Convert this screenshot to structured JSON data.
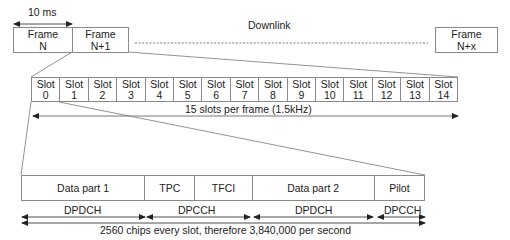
{
  "diagram": {
    "title": "Downlink",
    "frame_duration": "10 ms",
    "frames": [
      {
        "line1": "Frame",
        "line2": "N"
      },
      {
        "line1": "Frame",
        "line2": "N+1"
      },
      {
        "line1": "Frame",
        "line2": "N+x"
      }
    ],
    "slots": [
      {
        "line1": "Slot",
        "line2": "0"
      },
      {
        "line1": "Slot",
        "line2": "1"
      },
      {
        "line1": "Slot",
        "line2": "2"
      },
      {
        "line1": "Slot",
        "line2": "3"
      },
      {
        "line1": "Slot",
        "line2": "4"
      },
      {
        "line1": "Slot",
        "line2": "5"
      },
      {
        "line1": "Slot",
        "line2": "6"
      },
      {
        "line1": "Slot",
        "line2": "7"
      },
      {
        "line1": "Slot",
        "line2": "8"
      },
      {
        "line1": "Slot",
        "line2": "9"
      },
      {
        "line1": "Slot",
        "line2": "10"
      },
      {
        "line1": "Slot",
        "line2": "11"
      },
      {
        "line1": "Slot",
        "line2": "12"
      },
      {
        "line1": "Slot",
        "line2": "13"
      },
      {
        "line1": "Slot",
        "line2": "14"
      }
    ],
    "slots_caption": "15 slots per frame (1.5kHz)",
    "slot_parts": [
      {
        "label": "Data part 1"
      },
      {
        "label": "TPC"
      },
      {
        "label": "TFCI"
      },
      {
        "label": "Data part 2"
      },
      {
        "label": "Pilot"
      }
    ],
    "channel_labels": [
      {
        "label": "DPDCH"
      },
      {
        "label": "DPCCH"
      },
      {
        "label": "DPDCH"
      },
      {
        "label": "DPCCH"
      }
    ],
    "chips_caption": "2560 chips every slot, therefore 3,840,000 per second",
    "colors": {
      "line": "#8a8a8a",
      "arrow": "#222222",
      "text": "#222222"
    }
  }
}
